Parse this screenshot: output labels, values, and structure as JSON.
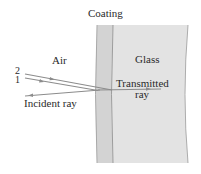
{
  "diagram": {
    "labels": {
      "coating": "Coating",
      "air": "Air",
      "glass": "Glass",
      "transmitted": "Transmitted",
      "ray": "ray",
      "reflected_2": "2",
      "reflected_1": "1",
      "incident": "Incident ray"
    },
    "colors": {
      "coating_fill": "#d3d3d3",
      "glass_fill": "#e3e3e3",
      "boundary": "#9a9a9a",
      "ray": "#8c8c8c",
      "text": "#2a2a2a"
    }
  }
}
